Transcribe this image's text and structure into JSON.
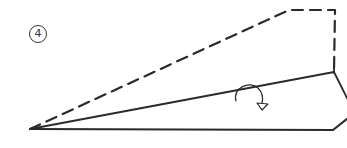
{
  "diagram": {
    "step_number": "4",
    "step_label_glyph": "④",
    "line_color": "#2a2a2a",
    "apex": [
      30,
      129
    ],
    "dashed_edge": [
      [
        30,
        129
      ],
      [
        289,
        10
      ],
      [
        335,
        10
      ],
      [
        334,
        72
      ]
    ],
    "fold_line": [
      [
        30,
        129
      ],
      [
        334,
        72
      ]
    ],
    "right_edge_upper": [
      [
        334,
        72
      ],
      [
        347,
        100
      ]
    ],
    "bottom_edge": [
      [
        30,
        129
      ],
      [
        333,
        130
      ],
      [
        347,
        118
      ]
    ],
    "fold_arrow": {
      "start": [
        236,
        100
      ],
      "control": [
        250,
        70
      ],
      "end": [
        262,
        104
      ],
      "direction": "down"
    }
  }
}
